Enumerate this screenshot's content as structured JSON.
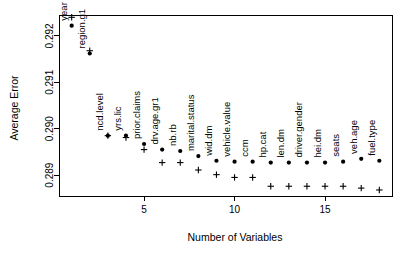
{
  "chart_data": {
    "type": "scatter",
    "title": "",
    "xlabel": "Number of Variables",
    "ylabel": "Average Error",
    "xlim": [
      0.3,
      18.7
    ],
    "ylim": [
      0.28855,
      0.29245
    ],
    "grid": false,
    "legend": null,
    "xticks": [
      5,
      10,
      15
    ],
    "xtick_labels": [
      "5",
      "10",
      "15"
    ],
    "yticks": [
      0.289,
      0.29,
      0.291,
      0.292
    ],
    "ytick_labels": [
      "0.289",
      "0.290",
      "0.291",
      "0.292"
    ],
    "x": [
      1,
      2,
      3,
      4,
      5,
      6,
      7,
      8,
      9,
      10,
      11,
      12,
      13,
      14,
      15,
      16,
      17,
      18
    ],
    "point_labels": [
      "year",
      "region.g1",
      "ncd.level",
      "yrs.lic",
      "prior.claims",
      "drv.age.gr1",
      "nb.rb",
      "marital.status",
      "wid.dm",
      "vehicle.value",
      "ccm",
      "hp.cat",
      "len.dm",
      "driver.gender",
      "hei.dm",
      "seats",
      "veh.age",
      "fuel.type"
    ],
    "series": [
      {
        "name": "dot-series",
        "marker": "dot",
        "values": [
          0.29222,
          0.29162,
          0.28985,
          0.28985,
          0.28967,
          0.28955,
          0.28952,
          0.28941,
          0.28931,
          0.28929,
          0.28929,
          0.28927,
          0.28927,
          0.28927,
          0.28927,
          0.28929,
          0.28935,
          0.28931
        ]
      },
      {
        "name": "plus-series",
        "marker": "plus",
        "values": [
          0.2924,
          0.29168,
          0.28985,
          0.28981,
          0.28955,
          0.28927,
          0.28927,
          0.28911,
          0.28901,
          0.28895,
          0.28895,
          0.28876,
          0.28876,
          0.28876,
          0.28876,
          0.28876,
          0.28872,
          0.28868
        ]
      }
    ]
  }
}
